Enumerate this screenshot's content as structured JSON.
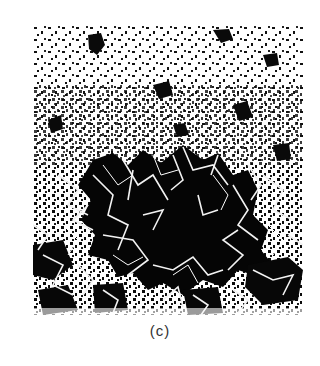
{
  "figure": {
    "panel_label": "(c)",
    "image_description": "Binary micrograph: speckled white region at top, large irregular dark void in center-bottom crossed by a white fiber/crack network",
    "colors": {
      "background": "#ffffff",
      "dark_region": "#0a0a0a",
      "fiber": "#f2f2f2",
      "caption": "#333333"
    }
  }
}
